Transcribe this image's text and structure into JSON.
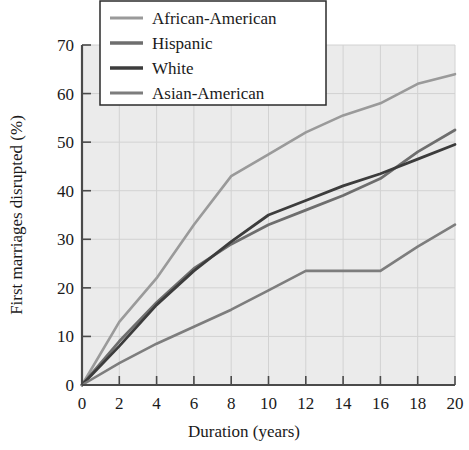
{
  "chart_data": {
    "type": "line",
    "title": "",
    "xlabel": "Duration (years)",
    "ylabel": "First marriages disrupted (%)",
    "xlim": [
      0,
      20
    ],
    "ylim": [
      0,
      70
    ],
    "xticks": [
      0,
      2,
      4,
      6,
      8,
      10,
      12,
      14,
      16,
      18,
      20
    ],
    "yticks": [
      0,
      10,
      20,
      30,
      40,
      50,
      60,
      70
    ],
    "xtick_labels": [
      "0",
      "2",
      "4",
      "6",
      "8",
      "10",
      "12",
      "14",
      "16",
      "18",
      "20"
    ],
    "ytick_labels": [
      "0",
      "10",
      "20",
      "30",
      "40",
      "50",
      "60",
      "70"
    ],
    "grid": true,
    "legend_position": "top-left",
    "x": [
      0,
      2,
      4,
      6,
      8,
      10,
      12,
      14,
      16,
      18,
      20
    ],
    "series": [
      {
        "name": "African-American",
        "color": "#9a9a9a",
        "width": 2.6,
        "values": [
          0,
          13,
          22,
          33,
          43,
          47.5,
          52,
          55.5,
          58,
          62,
          64
        ]
      },
      {
        "name": "Hispanic",
        "color": "#6e6e6e",
        "width": 2.8,
        "values": [
          0,
          9,
          17,
          24,
          29,
          33,
          36,
          39,
          42.5,
          48,
          52.5
        ]
      },
      {
        "name": "White",
        "color": "#3c3c3c",
        "width": 2.8,
        "values": [
          0,
          8,
          16.5,
          23.5,
          29.5,
          35,
          38,
          41,
          43.5,
          46.5,
          49.5
        ]
      },
      {
        "name": "Asian-American",
        "color": "#7d7d7d",
        "width": 2.6,
        "values": [
          0,
          4.5,
          8.5,
          12,
          15.5,
          19.5,
          23.5,
          23.5,
          23.5,
          28.5,
          33
        ]
      }
    ]
  },
  "legend": {
    "items": [
      {
        "label": "African-American"
      },
      {
        "label": "Hispanic"
      },
      {
        "label": "White"
      },
      {
        "label": "Asian-American"
      }
    ]
  }
}
